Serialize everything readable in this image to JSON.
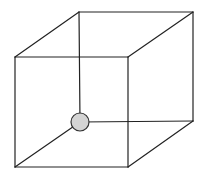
{
  "diagram": {
    "type": "necker-cube",
    "stroke_color": "#222222",
    "background": "#ffffff",
    "vertices": {
      "front_top_left": [
        15,
        57
      ],
      "front_top_right": [
        128,
        57
      ],
      "front_bottom_left": [
        15,
        167
      ],
      "front_bottom_right": [
        128,
        167
      ],
      "back_top_left": [
        79,
        12
      ],
      "back_top_right": [
        193,
        12
      ],
      "back_bottom_left": [
        80,
        122
      ],
      "back_bottom_right": [
        193,
        121
      ]
    },
    "marker": {
      "shape": "circle",
      "center": [
        80,
        122
      ],
      "radius": 9,
      "fill": "#d4d4d4",
      "stroke": "#333333"
    }
  }
}
